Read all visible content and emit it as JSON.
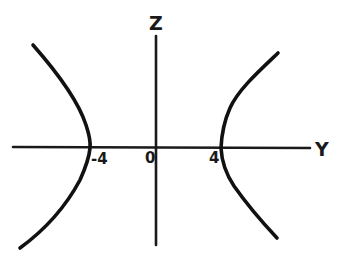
{
  "figure": {
    "axes": {
      "horizontal": {
        "label": "Y"
      },
      "vertical": {
        "label": "Z"
      }
    },
    "tick_labels": {
      "origin": "0",
      "left_vertex": "-4",
      "right_vertex": "4"
    },
    "vertices": [
      {
        "y": -4,
        "z": 0
      },
      {
        "y": 4,
        "z": 0
      }
    ],
    "branches": [
      {
        "name": "left-branch",
        "opens": "left"
      },
      {
        "name": "right-branch",
        "opens": "right"
      }
    ]
  }
}
